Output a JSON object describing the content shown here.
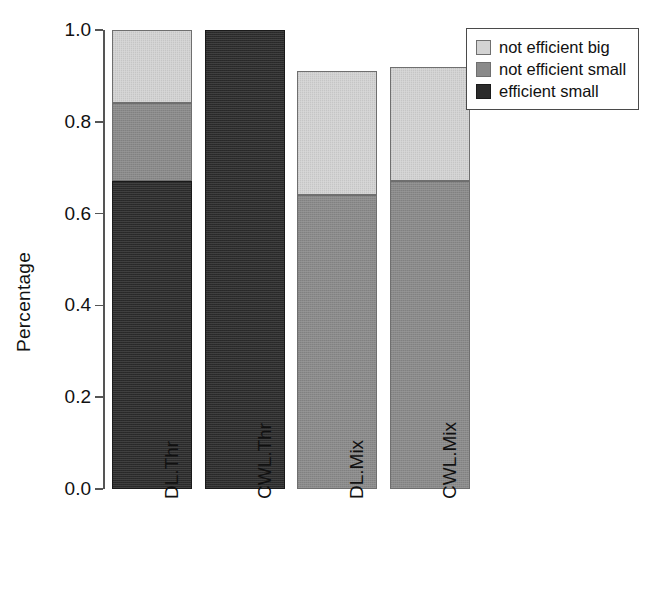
{
  "chart_data": {
    "type": "bar",
    "subtype": "stacked-bar",
    "title": "",
    "xlabel": "",
    "ylabel": "Percentage",
    "categories": [
      "DL.Thr",
      "CWL.Thr",
      "DL.Mix",
      "CWL.Mix"
    ],
    "series": [
      {
        "name": "efficient small",
        "color": "#2b2b2b",
        "values": [
          0.67,
          1.0,
          0.0,
          0.0
        ]
      },
      {
        "name": "not efficient small",
        "color": "#8a8a8a",
        "values": [
          0.17,
          0.0,
          0.64,
          0.67
        ]
      },
      {
        "name": "not efficient big",
        "color": "#d3d3d3",
        "values": [
          0.16,
          0.0,
          0.27,
          0.25
        ]
      }
    ],
    "stack_order_bottom_to_top": [
      "efficient small",
      "not efficient small",
      "not efficient big"
    ],
    "bar_totals": [
      1.0,
      1.0,
      0.91,
      0.92
    ],
    "ylim": [
      0.0,
      1.0
    ],
    "yticks": [
      "0.0",
      "0.2",
      "0.4",
      "0.6",
      "0.8",
      "1.0"
    ],
    "ytick_values": [
      0.0,
      0.2,
      0.4,
      0.6,
      0.8,
      1.0
    ],
    "grid": false,
    "legend_position": "top-right",
    "legend_entries": [
      "not efficient big",
      "not efficient small",
      "efficient small"
    ]
  },
  "axis": {
    "ylabel": "Percentage"
  },
  "legend": {
    "items": [
      {
        "label": "not efficient big",
        "color": "#d3d3d3"
      },
      {
        "label": "not efficient small",
        "color": "#8a8a8a"
      },
      {
        "label": "efficient small",
        "color": "#2b2b2b"
      }
    ]
  }
}
